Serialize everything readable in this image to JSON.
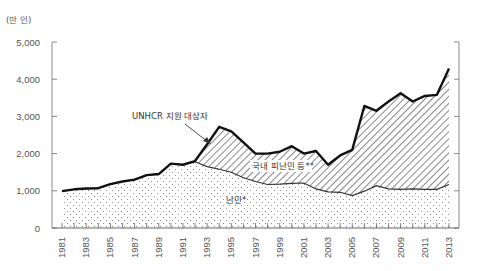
{
  "chart_data": {
    "type": "area",
    "title": "",
    "unit_label": "(만 인)",
    "xlabel": "",
    "ylabel": "(만 인)",
    "ylim": [
      0,
      5000
    ],
    "yticks": [
      0,
      1000,
      2000,
      3000,
      4000,
      5000
    ],
    "ytick_labels": [
      "0",
      "1,000",
      "2,000",
      "3,000",
      "4,000",
      "5,000"
    ],
    "x": [
      1981,
      1982,
      1983,
      1984,
      1985,
      1986,
      1987,
      1988,
      1989,
      1990,
      1991,
      1992,
      1993,
      1994,
      1995,
      1996,
      1997,
      1998,
      1999,
      2000,
      2001,
      2002,
      2003,
      2004,
      2005,
      2006,
      2007,
      2008,
      2009,
      2010,
      2011,
      2012,
      2013
    ],
    "xtick_labels": [
      "1981",
      "1983",
      "1985",
      "1987",
      "1989",
      "1991",
      "1993",
      "1995",
      "1997",
      "1999",
      "2001",
      "2003",
      "2005",
      "2007",
      "2009",
      "2011",
      "2013"
    ],
    "grid": false,
    "legend_position": "inline annotations",
    "series": [
      {
        "name": "난민*",
        "fill": "dotted",
        "values": [
          990,
          1040,
          1060,
          1070,
          1180,
          1250,
          1300,
          1420,
          1450,
          1730,
          1700,
          1780,
          1650,
          1580,
          1500,
          1350,
          1250,
          1170,
          1180,
          1200,
          1210,
          1050,
          970,
          960,
          870,
          990,
          1140,
          1050,
          1040,
          1050,
          1040,
          1040,
          1170
        ]
      },
      {
        "name": "국내 피난민 등**",
        "fill": "hatched",
        "values": [
          0,
          0,
          0,
          0,
          0,
          0,
          0,
          0,
          0,
          0,
          0,
          20,
          600,
          1140,
          1100,
          950,
          750,
          830,
          870,
          1000,
          790,
          1020,
          730,
          990,
          1230,
          2290,
          2010,
          2350,
          2580,
          2350,
          2510,
          2540,
          3120
        ]
      },
      {
        "name": "UNHCR 지원 대상자",
        "line": "bold",
        "values": [
          990,
          1040,
          1060,
          1070,
          1180,
          1250,
          1300,
          1420,
          1450,
          1730,
          1700,
          1800,
          2250,
          2720,
          2600,
          2300,
          2000,
          2000,
          2050,
          2200,
          2000,
          2070,
          1700,
          1950,
          2100,
          3280,
          3150,
          3400,
          3620,
          3400,
          3550,
          3580,
          4290
        ]
      }
    ],
    "annotations": [
      {
        "text": "UNHCR 지원 대상자",
        "points_to": 1993
      },
      {
        "text": "국내 피난민 등**",
        "region": "hatched"
      },
      {
        "text": "난민*",
        "region": "dotted"
      }
    ]
  }
}
